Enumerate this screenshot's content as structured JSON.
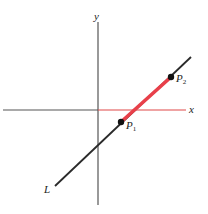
{
  "figure": {
    "type": "coordinate-line-diagram",
    "axes": {
      "x_label": "x",
      "y_label": "y",
      "origin_px": [
        98,
        110
      ],
      "axis_color": "#555555",
      "positive_x_axis_color": "#e04848"
    },
    "line": {
      "label": "L",
      "start_px": [
        55,
        186
      ],
      "end_px": [
        191,
        57
      ],
      "color": "#2a2a2a"
    },
    "segment": {
      "from": "P1",
      "to": "P2",
      "color": "#e8404a"
    },
    "points": [
      {
        "label": "P",
        "subscript": "1",
        "px": [
          121,
          122
        ]
      },
      {
        "label": "P",
        "subscript": "2",
        "px": [
          171,
          77
        ]
      }
    ]
  }
}
